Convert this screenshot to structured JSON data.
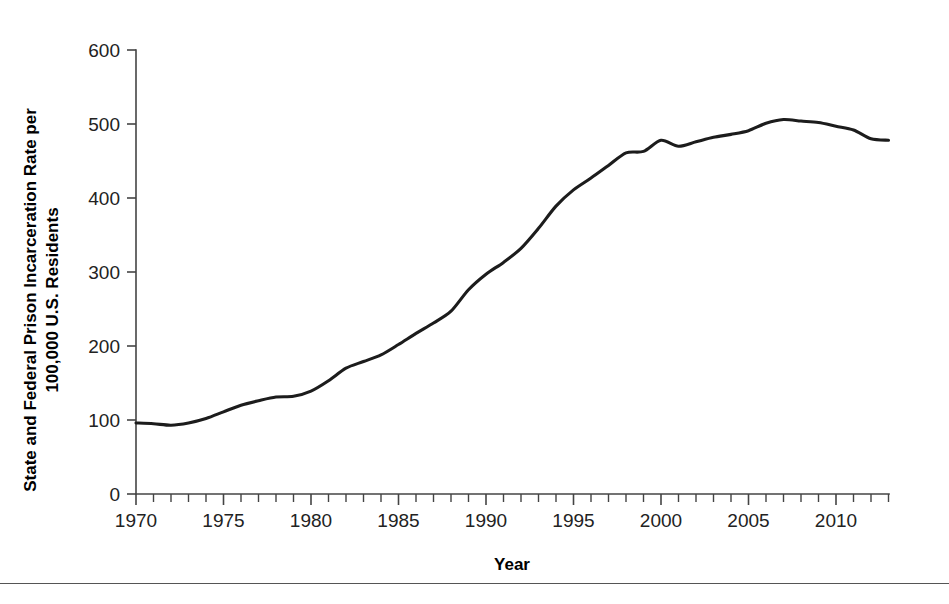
{
  "chart_data": {
    "type": "line",
    "title": "",
    "xlabel": "Year",
    "ylabel": "State and Federal Prison Incarceration Rate per 100,000 U.S. Residents",
    "xlim": [
      1970,
      2013
    ],
    "ylim": [
      0,
      600
    ],
    "grid": false,
    "legend": "none",
    "y_ticks": [
      0,
      100,
      200,
      300,
      400,
      500,
      600
    ],
    "y_tick_labels": [
      "0",
      "100",
      "200",
      "300",
      "400",
      "500",
      "600"
    ],
    "x_ticks": [
      1970,
      1975,
      1980,
      1985,
      1990,
      1995,
      2000,
      2005,
      2010
    ],
    "x_tick_labels": [
      "1970",
      "1975",
      "1980",
      "1985",
      "1990",
      "1995",
      "2000",
      "2005",
      "2010"
    ],
    "x_minor_tick_step": 1,
    "series": [
      {
        "name": "State and Federal Prison Incarceration Rate",
        "color": "#1c1c1c",
        "x": [
          1970,
          1971,
          1972,
          1973,
          1974,
          1975,
          1976,
          1977,
          1978,
          1979,
          1980,
          1981,
          1982,
          1983,
          1984,
          1985,
          1986,
          1987,
          1988,
          1989,
          1990,
          1991,
          1992,
          1993,
          1994,
          1995,
          1996,
          1997,
          1998,
          1999,
          2000,
          2001,
          2002,
          2003,
          2004,
          2005,
          2006,
          2007,
          2008,
          2009,
          2010,
          2011,
          2012,
          2013
        ],
        "values": [
          96,
          95,
          93,
          96,
          102,
          111,
          120,
          126,
          131,
          132,
          139,
          153,
          170,
          179,
          188,
          202,
          217,
          231,
          247,
          276,
          297,
          313,
          332,
          359,
          389,
          411,
          427,
          444,
          461,
          463,
          478,
          470,
          476,
          482,
          486,
          491,
          501,
          506,
          504,
          502,
          497,
          492,
          480,
          478
        ]
      }
    ],
    "annotations": [
      {
        "label": "1972 low",
        "x": 1972,
        "y": 93
      },
      {
        "label": "1978-1980 plateau",
        "x": 1979,
        "y": 132
      },
      {
        "label": "2000 local peak",
        "x": 2000,
        "y": 478
      },
      {
        "label": "2001 dip",
        "x": 2001,
        "y": 470
      },
      {
        "label": "2007 peak",
        "x": 2007,
        "y": 506
      },
      {
        "label": "2013 end",
        "x": 2013,
        "y": 478
      }
    ]
  },
  "figure": {
    "background": "#ffffff",
    "axis_color": "#444444",
    "line_color": "#1c1c1c",
    "footer_rule_color": "#555555"
  }
}
